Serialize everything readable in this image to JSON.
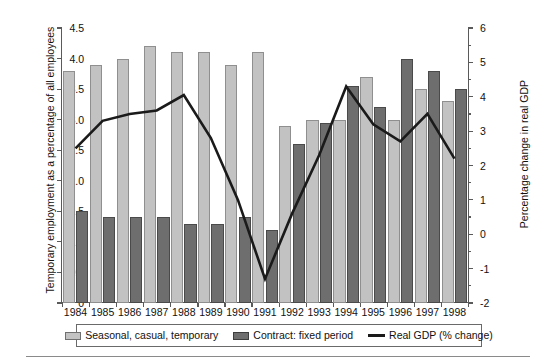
{
  "chart_data": {
    "type": "bar",
    "title": "",
    "subtitle": "",
    "xlabel": "",
    "ylabel": "Temporary employment as a percentage of all employees",
    "y2label": "Percentage change in real GDP",
    "ylim": [
      0,
      4.5
    ],
    "y2lim": [
      -2,
      6
    ],
    "yticks": [
      "0",
      "0.5",
      "1.0",
      "1.5",
      "2.0",
      "2.5",
      "3.0",
      "3.5",
      "4.0",
      "4.5"
    ],
    "ytick_values": [
      0,
      0.5,
      1.0,
      1.5,
      2.0,
      2.5,
      3.0,
      3.5,
      4.0,
      4.5
    ],
    "y2ticks": [
      "-2",
      "-1",
      "0",
      "1",
      "2",
      "3",
      "4",
      "5",
      "6"
    ],
    "y2tick_values": [
      -2,
      -1,
      0,
      1,
      2,
      3,
      4,
      5,
      6
    ],
    "grid": false,
    "legend_position": "bottom",
    "categories": [
      "1984",
      "1985",
      "1986",
      "1987",
      "1988",
      "1989",
      "1990",
      "1991",
      "1992",
      "1993",
      "1994",
      "1995",
      "1996",
      "1997",
      "1998"
    ],
    "series": [
      {
        "name": "Seasonal, casual, temporary",
        "type": "bar",
        "axis": "left",
        "color": "#c2c2c2",
        "values": [
          3.8,
          3.9,
          4.0,
          4.2,
          4.1,
          4.1,
          3.9,
          4.1,
          2.9,
          3.0,
          3.0,
          3.7,
          3.0,
          3.5,
          3.3
        ]
      },
      {
        "name": "Contract: fixed period",
        "type": "bar",
        "axis": "left",
        "color": "#6e6e6e",
        "values": [
          1.5,
          1.4,
          1.4,
          1.4,
          1.3,
          1.3,
          1.4,
          1.2,
          2.6,
          2.95,
          3.55,
          3.2,
          4.0,
          3.8,
          3.5
        ]
      },
      {
        "name": "Real GDP (% change)",
        "type": "line",
        "axis": "right",
        "color": "#1a1a1a",
        "values": [
          2.5,
          3.3,
          3.5,
          3.6,
          4.05,
          2.8,
          1.0,
          -1.3,
          0.6,
          2.3,
          4.3,
          3.2,
          2.7,
          3.5,
          2.2
        ]
      }
    ]
  },
  "legend": {
    "items": [
      {
        "label": "Seasonal, casual, temporary",
        "swatch": "light-bar-swatch"
      },
      {
        "label": "Contract: fixed period",
        "swatch": "dark-bar-swatch"
      },
      {
        "label": "Real GDP (% change)",
        "swatch": "line-swatch"
      }
    ]
  }
}
